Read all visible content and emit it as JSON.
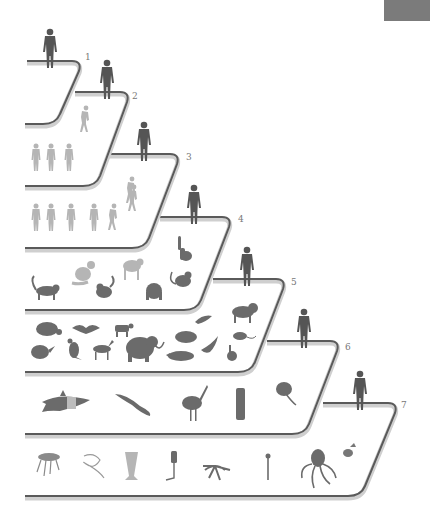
{
  "figure": {
    "title": "",
    "corner_tab_color": "#7b7b7b",
    "line_color": "#5a5a5a",
    "tiers": [
      {
        "step": "1",
        "label": "1",
        "organisms": []
      },
      {
        "step": "2",
        "label": "2",
        "organisms": [
          "hominin-walking"
        ]
      },
      {
        "step": "3",
        "label": "3",
        "organisms": [
          "hominin-1",
          "hominin-2",
          "hominin-3",
          "hominin-stooped"
        ]
      },
      {
        "step": "4",
        "label": "4",
        "organisms": [
          "hominin-1",
          "hominin-2",
          "hominin-3",
          "hominin-4",
          "hominin-5",
          "hominin-6",
          "chimpanzee"
        ]
      },
      {
        "step": "5",
        "label": "5",
        "organisms": [
          "lemur",
          "monkey",
          "gorilla-faded",
          "chimp-faded",
          "howler-monkey",
          "orangutan",
          "tarsier"
        ]
      },
      {
        "step": "6",
        "label": "6",
        "organisms": [
          "turtle-like-mammal",
          "bat",
          "cow",
          "bird",
          "lion",
          "armadillo",
          "kangaroo",
          "horse",
          "mammoth",
          "tortoise",
          "dolphin",
          "platypus",
          "rat",
          "rabbit"
        ]
      },
      {
        "step": "7",
        "label": "7",
        "organisms": [
          "shark",
          "lizard",
          "ostrich",
          "tree-stump",
          "frog",
          "jellyfish",
          "worm",
          "sponge",
          "tubeworm",
          "starfish",
          "coral-polyp",
          "octopus",
          "fly"
        ]
      }
    ]
  }
}
